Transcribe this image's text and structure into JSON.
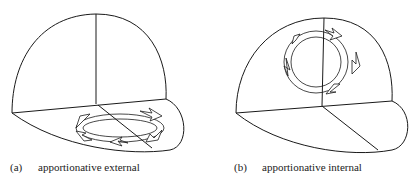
{
  "figure": {
    "panels": [
      {
        "id": "a",
        "label": "(a)",
        "caption": "apportionative external",
        "arrow_location": "brim"
      },
      {
        "id": "b",
        "label": "(b)",
        "caption": "apportionative internal",
        "arrow_location": "crown"
      }
    ],
    "colors": {
      "stroke": "#1a1a1a",
      "background": "#ffffff"
    }
  }
}
